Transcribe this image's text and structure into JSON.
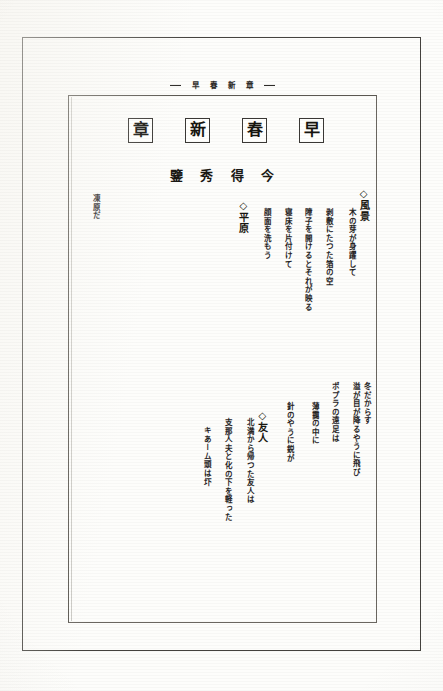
{
  "document": {
    "kind": "scanned-book-page",
    "orientation": "vertical-rtl",
    "running_header": {
      "text": "早春新章",
      "chars": [
        "早",
        "春",
        "新",
        "章"
      ]
    },
    "title": {
      "text": "早春新章",
      "boxed_chars": [
        "早",
        "春",
        "新",
        "章"
      ]
    },
    "author": {
      "text": "今得秀鑒",
      "chars": [
        "今",
        "得",
        "秀",
        "鑒"
      ]
    }
  },
  "poems": [
    {
      "heading": "◇風景",
      "heading_marker": "◇",
      "heading_title": "風景",
      "columns": [
        "木の芽が身躍して",
        "剥敷にたつた箔の空",
        "障子を開けるとそれが映る",
        "寝床を片付けて",
        "顔面を洗もう"
      ]
    },
    {
      "heading": "◇平原",
      "heading_marker": "◇",
      "heading_title": "平原",
      "columns": [
        "凍原だ"
      ]
    },
    {
      "heading": "◇友人",
      "heading_marker": "◇",
      "heading_title": "友人",
      "columns": [
        "冬だからす",
        "溢が目が降るやうに飛び",
        "ポプラの遠足は",
        "薄靄の中に",
        "針のやうに鋭が"
      ]
    },
    {
      "heading": "◇友人",
      "heading_marker": "◇",
      "heading_title": "友人",
      "columns": [
        "北満から帰つた友人は",
        "支那人夫と化の下を軽った",
        "キあーム頭は圷"
      ]
    }
  ],
  "groups": {
    "upper": {
      "poem_landscape": {
        "heading": "◇風景",
        "col_1": "木の芽が身躍して",
        "col_2": "剥敷にたつた箔の空",
        "col_3": "障子を開けるとそれが映る",
        "col_4": "寝床を片付けて",
        "col_5": "顔面を洗もう"
      },
      "poem_plain": {
        "heading": "◇平原"
      },
      "tail_note": "凍原だ"
    },
    "lower": {
      "poem_winter": {
        "col_1": "冬だからす",
        "col_2": "溢が目が降るやうに飛び",
        "col_3": "ポプラの遠足は",
        "col_4": "薄靄の中に",
        "col_5": "針のやうに鋭が"
      },
      "poem_friend": {
        "heading": "◇友人",
        "col_1": "北満から帰つた友人は",
        "col_2": "支那人夫と化の下を軽った",
        "col_3": "キあーム頭は圷"
      }
    }
  },
  "colors": {
    "page_background": "#fdfdfb",
    "ink": "#26241f",
    "border": "#44423e",
    "inner_border": "#5a5751"
  }
}
